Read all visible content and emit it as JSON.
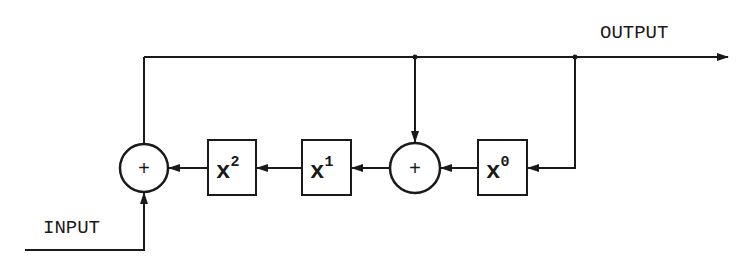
{
  "diagram": {
    "title": "",
    "labels": {
      "output": "OUTPUT",
      "input": "INPUT"
    },
    "adders": [
      {
        "id": "adder-left",
        "symbol": "+"
      },
      {
        "id": "adder-middle",
        "symbol": "+"
      }
    ],
    "blocks": [
      {
        "id": "block-x2",
        "base": "x",
        "exponent": "2"
      },
      {
        "id": "block-x1",
        "base": "x",
        "exponent": "1"
      },
      {
        "id": "block-x0",
        "base": "x",
        "exponent": "0"
      }
    ],
    "colors": {
      "stroke": "#1a1a1a",
      "background": "#ffffff"
    }
  }
}
